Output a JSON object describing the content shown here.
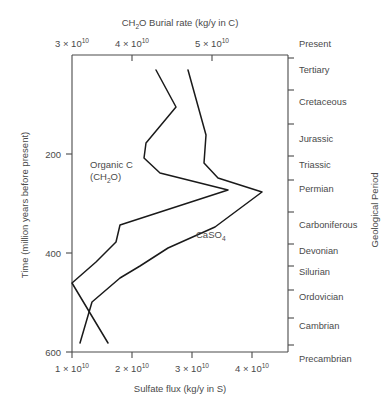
{
  "chart_data": {
    "type": "line",
    "title": "",
    "top_axis": {
      "label": "CH2O Burial rate (kg/y in C)",
      "label_parts": {
        "pre": "CH",
        "sub": "2",
        "post": "O Burial rate (kg/y in C)"
      },
      "ticks": [
        {
          "value": 3,
          "text_mantissa": "3 × 10",
          "text_exponent": "10",
          "x": 72
        },
        {
          "value": 4,
          "text_mantissa": "4 × 10",
          "text_exponent": "10",
          "x": 132
        },
        {
          "value": 5,
          "text_mantissa": "5 × 10",
          "text_exponent": "10",
          "x": 212
        }
      ],
      "unit_note": "×10^10 kg/y in C"
    },
    "bottom_axis": {
      "label": "Sulfate flux (kg/y in S)",
      "ticks": [
        {
          "value": 1,
          "text_mantissa": "1 × 10",
          "text_exponent": "10",
          "x": 72
        },
        {
          "value": 2,
          "text_mantissa": "2 × 10",
          "text_exponent": "10",
          "x": 132
        },
        {
          "value": 3,
          "text_mantissa": "3 × 10",
          "text_exponent": "10",
          "x": 192
        },
        {
          "value": 4,
          "text_mantissa": "4 × 10",
          "text_exponent": "10",
          "x": 252
        }
      ],
      "unit_note": "×10^10 kg/y in S"
    },
    "left_axis": {
      "label": "Time (million years before present)",
      "ticks": [
        {
          "value": 200,
          "text": "200",
          "y": 154
        },
        {
          "value": 400,
          "text": "400",
          "y": 253
        },
        {
          "value": 600,
          "text": "600",
          "y": 352
        }
      ],
      "range": [
        0,
        620
      ],
      "direction": "increasing-downward"
    },
    "right_axis": {
      "label": "Geological Period",
      "periods": [
        {
          "name": "Present",
          "y": 47
        },
        {
          "name": "Tertiary",
          "y": 73
        },
        {
          "name": "Cretaceous",
          "y": 105
        },
        {
          "name": "Jurassic",
          "y": 142
        },
        {
          "name": "Triassic",
          "y": 168
        },
        {
          "name": "Permian",
          "y": 192
        },
        {
          "name": "Carboniferous",
          "y": 228
        },
        {
          "name": "Devonian",
          "y": 254
        },
        {
          "name": "Silurian",
          "y": 275
        },
        {
          "name": "Ordovician",
          "y": 300
        },
        {
          "name": "Cambrian",
          "y": 329
        },
        {
          "name": "Precambrian",
          "y": 362
        }
      ],
      "tick_y": [
        58,
        90,
        124,
        156,
        180,
        212,
        244,
        266,
        290,
        318,
        345
      ]
    },
    "grid": false,
    "legend_position": "inline-annotations",
    "series": [
      {
        "name": "Organic C (CH2O)",
        "axis": "top",
        "label_x": 90,
        "label_y": 168,
        "points": [
          {
            "x": 156,
            "y": 70
          },
          {
            "x": 176,
            "y": 107
          },
          {
            "x": 146,
            "y": 143
          },
          {
            "x": 144,
            "y": 158
          },
          {
            "x": 160,
            "y": 173
          },
          {
            "x": 228,
            "y": 190
          },
          {
            "x": 120,
            "y": 225
          },
          {
            "x": 116,
            "y": 242
          },
          {
            "x": 96,
            "y": 262
          },
          {
            "x": 72,
            "y": 283
          },
          {
            "x": 108,
            "y": 343
          }
        ]
      },
      {
        "name": "CaSO4",
        "axis": "bottom",
        "label_x": 196,
        "label_y": 238,
        "points": [
          {
            "x": 188,
            "y": 70
          },
          {
            "x": 206,
            "y": 135
          },
          {
            "x": 204,
            "y": 163
          },
          {
            "x": 218,
            "y": 178
          },
          {
            "x": 262,
            "y": 192
          },
          {
            "x": 215,
            "y": 227
          },
          {
            "x": 168,
            "y": 248
          },
          {
            "x": 140,
            "y": 266
          },
          {
            "x": 120,
            "y": 278
          },
          {
            "x": 92,
            "y": 302
          },
          {
            "x": 80,
            "y": 343
          }
        ]
      }
    ],
    "plot_frame": {
      "left": 72,
      "right": 288,
      "top": 55,
      "bottom": 352
    }
  }
}
